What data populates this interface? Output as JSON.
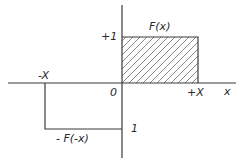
{
  "diagram": {
    "type": "function-plot",
    "colors": {
      "line": "#3a3a3a",
      "hatch": "#6a6a6a",
      "background": "#ffffff"
    },
    "axes": {
      "x_label": "x",
      "origin_label": "0"
    },
    "labels": {
      "plus_one": "+1",
      "f_x": "F(x)",
      "minus_X": "-X",
      "plus_X": "+X",
      "minus_f_minus_x": "- F(-x)",
      "minus_one_level": "1"
    },
    "shapes": {
      "positive_rect": {
        "x_from": 0,
        "x_to": "+X",
        "y": 1,
        "hatched": true
      },
      "negative_step": {
        "x_from": "-X",
        "x_to": 0,
        "y": -1,
        "hatched": false
      }
    }
  }
}
